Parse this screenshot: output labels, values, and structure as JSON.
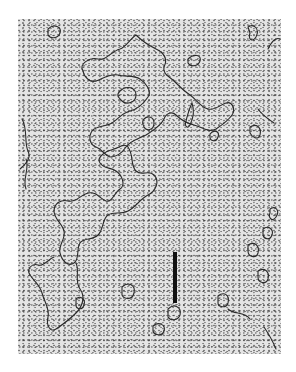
{
  "image": {
    "description": "Electron micrograph of spread DNA molecules (strands and circular loops) on a stippled background",
    "background_color": "#e4e4e4",
    "strand_color": "#2a2a2a",
    "page_background": "#ffffff"
  },
  "scale_bar": {
    "x": 173,
    "y": 252,
    "width": 4,
    "height": 51,
    "color": "#111111",
    "label": ""
  }
}
